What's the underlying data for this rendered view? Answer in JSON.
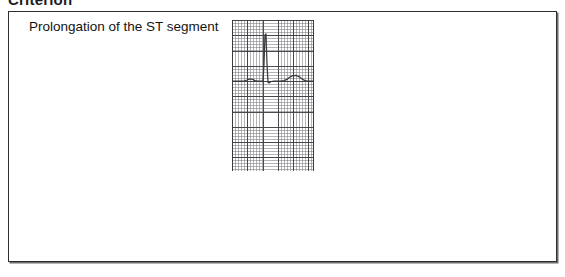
{
  "page": {
    "heading": "Criterion"
  },
  "figure": {
    "criterion_label": "Prolongation of the ST segment",
    "ecg": {
      "name": "ecg-waveform-strip",
      "grid_minor_color": "#787880",
      "grid_major_color": "#3c3c42",
      "trace_color": "#3a3a3e",
      "baseline_y": 61,
      "features": [
        {
          "name": "p-wave",
          "label": "P"
        },
        {
          "name": "qrs-complex",
          "label": "QRS"
        },
        {
          "name": "st-segment",
          "label": "ST"
        },
        {
          "name": "t-wave",
          "label": "T"
        }
      ],
      "trace_path": "M 0,61 L 12,61 L 15,60 L 17,59.2 L 19,59 L 21,59.6 L 23,60.6 L 26,61 L 30,61 L 31,61.8 L 32,44 L 33,15 L 34,14 L 35,44 L 36,62.5 L 37,63 L 39,61.5 L 42,61 L 48,61 L 52,60.6 L 55,59.4 L 58,57 L 61,55.6 L 64,55.4 L 67,56.6 L 70,59 L 73,60.6 L 76,61 L 82,61"
    }
  }
}
